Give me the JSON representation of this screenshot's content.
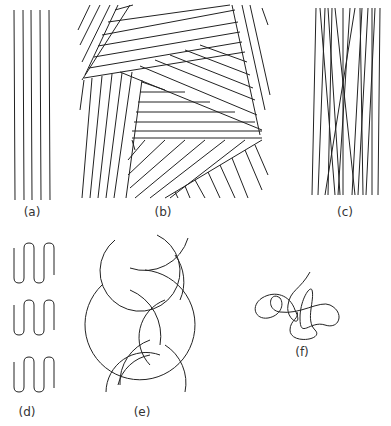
{
  "figure": {
    "panels": [
      {
        "id": "a",
        "label": "(a)",
        "description": "parallel straight chains"
      },
      {
        "id": "b",
        "label": "(b)",
        "description": "lamellar crystallites at various orientations"
      },
      {
        "id": "c",
        "label": "(c)",
        "description": "nearly parallel crossing chains"
      },
      {
        "id": "d",
        "label": "(d)",
        "description": "folded chains"
      },
      {
        "id": "e",
        "label": "(e)",
        "description": "helical / interlaced arcs"
      },
      {
        "id": "f",
        "label": "(f)",
        "description": "random coil"
      }
    ],
    "stroke_color": "#222222",
    "background": "#ffffff"
  }
}
